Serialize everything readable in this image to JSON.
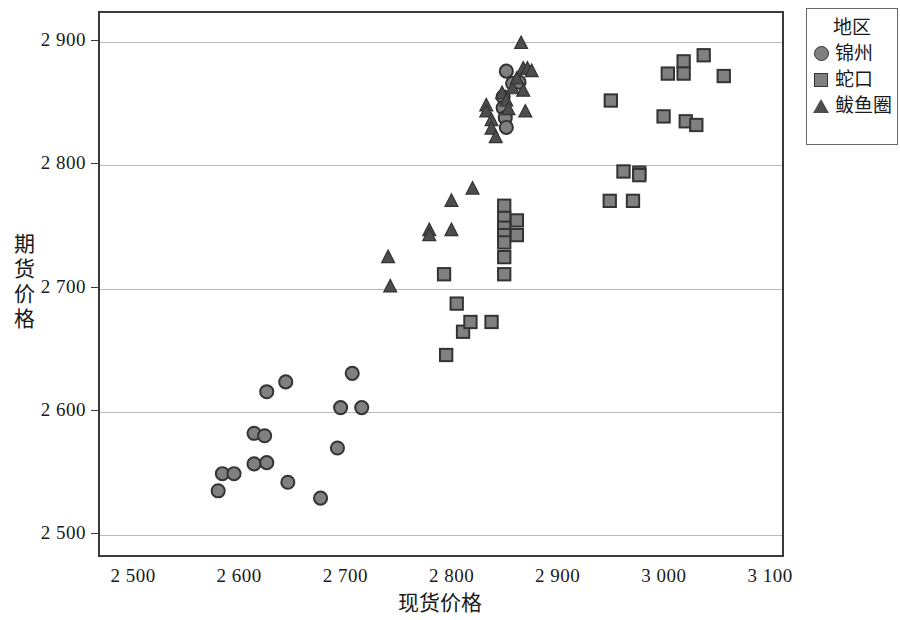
{
  "chart_data": {
    "type": "scatter",
    "title": "",
    "xlabel": "现货价格",
    "ylabel": "期货价格",
    "xlim": [
      2450,
      3150
    ],
    "ylim": [
      2470,
      2920
    ],
    "xticks": [
      "2 500",
      "2 600",
      "2 700",
      "2 800",
      "2 900",
      "3 000",
      "3 100"
    ],
    "xtick_values": [
      2500,
      2600,
      2700,
      2800,
      2900,
      3000,
      3100
    ],
    "yticks": [
      "2 500",
      "2 600",
      "2 700",
      "2 800",
      "2 900"
    ],
    "ytick_values": [
      2500,
      2600,
      2700,
      2800,
      2900
    ],
    "grid": "horizontal",
    "legend_position": "right-outside",
    "legend_title": "地区",
    "series": [
      {
        "name": "锦州",
        "marker": "circle",
        "color": "#808080",
        "edge_color": "#333333",
        "points": [
          [
            2625,
            2614
          ],
          [
            2643,
            2622
          ],
          [
            2706,
            2629
          ],
          [
            2695,
            2601
          ],
          [
            2715,
            2601
          ],
          [
            2613,
            2580
          ],
          [
            2623,
            2578
          ],
          [
            2613,
            2555
          ],
          [
            2625,
            2556
          ],
          [
            2692,
            2568
          ],
          [
            2583,
            2547
          ],
          [
            2594,
            2547
          ],
          [
            2645,
            2540
          ],
          [
            2579,
            2533
          ],
          [
            2676,
            2527
          ],
          [
            2852,
            2876
          ],
          [
            2858,
            2866
          ],
          [
            2849,
            2855
          ],
          [
            2864,
            2867
          ],
          [
            2849,
            2846
          ],
          [
            2851,
            2838
          ],
          [
            2852,
            2830
          ]
        ]
      },
      {
        "name": "蛇口",
        "marker": "square",
        "color": "#808080",
        "edge_color": "#333333",
        "points": [
          [
            2805,
            2686
          ],
          [
            2811,
            2663
          ],
          [
            2818,
            2671
          ],
          [
            2838,
            2671
          ],
          [
            2795,
            2644
          ],
          [
            2793,
            2710
          ],
          [
            2850,
            2710
          ],
          [
            2850,
            2766
          ],
          [
            2850,
            2756
          ],
          [
            2850,
            2748
          ],
          [
            2850,
            2742
          ],
          [
            2850,
            2736
          ],
          [
            2850,
            2724
          ],
          [
            2862,
            2754
          ],
          [
            2862,
            2742
          ],
          [
            2963,
            2794
          ],
          [
            2950,
            2770
          ],
          [
            2978,
            2793
          ],
          [
            2978,
            2791
          ],
          [
            2972,
            2770
          ],
          [
            3005,
            2874
          ],
          [
            3020,
            2884
          ],
          [
            3020,
            2874
          ],
          [
            3039,
            2889
          ],
          [
            3058,
            2872
          ],
          [
            3001,
            2839
          ],
          [
            3022,
            2835
          ],
          [
            3032,
            2832
          ],
          [
            2951,
            2852
          ]
        ]
      },
      {
        "name": "鲅鱼圈",
        "marker": "triangle",
        "color": "#4d4d4d",
        "edge_color": "#333333",
        "points": [
          [
            2740,
            2724
          ],
          [
            2779,
            2746
          ],
          [
            2779,
            2742
          ],
          [
            2800,
            2746
          ],
          [
            2820,
            2780
          ],
          [
            2800,
            2770
          ],
          [
            2833,
            2848
          ],
          [
            2833,
            2843
          ],
          [
            2838,
            2836
          ],
          [
            2838,
            2829
          ],
          [
            2842,
            2822
          ],
          [
            2848,
            2858
          ],
          [
            2852,
            2852
          ],
          [
            2854,
            2845
          ],
          [
            2858,
            2862
          ],
          [
            2862,
            2870
          ],
          [
            2866,
            2899
          ],
          [
            2868,
            2878
          ],
          [
            2872,
            2878
          ],
          [
            2876,
            2876
          ],
          [
            2868,
            2860
          ],
          [
            2870,
            2843
          ],
          [
            2742,
            2700
          ]
        ]
      }
    ]
  },
  "legend": {
    "title": "地区",
    "entries": [
      {
        "label": "锦州",
        "marker": "circle"
      },
      {
        "label": "蛇口",
        "marker": "square"
      },
      {
        "label": "鲅鱼圈",
        "marker": "triangle"
      }
    ]
  },
  "axes": {
    "x_title": "现货价格",
    "y_title": "期货价格",
    "y_title_chars": [
      "期",
      "货",
      "价",
      "格"
    ]
  }
}
